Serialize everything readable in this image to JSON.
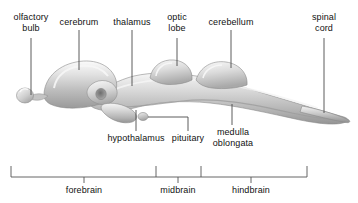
{
  "figure": {
    "kind": "anatomical-diagram",
    "background_color": "#ffffff",
    "text_color": "#111111",
    "leader_line_color": "#4a4a4a",
    "bracket_color": "#555555",
    "brain_fill_light": "#f2f2f2",
    "brain_fill_mid": "#c9c9c9",
    "brain_fill_dark": "#8e8e8e"
  },
  "callouts": {
    "olfactory_bulb": "olfactory\nbulb",
    "cerebrum": "cerebrum",
    "thalamus": "thalamus",
    "optic_lobe": "optic\nlobe",
    "cerebellum": "cerebellum",
    "spinal_cord": "spinal\ncord",
    "hypothalamus": "hypothalamus",
    "pituitary": "pituitary",
    "medulla_oblongata": "medulla\noblongata"
  },
  "regions": {
    "forebrain": "forebrain",
    "midbrain": "midbrain",
    "hindbrain": "hindbrain"
  }
}
